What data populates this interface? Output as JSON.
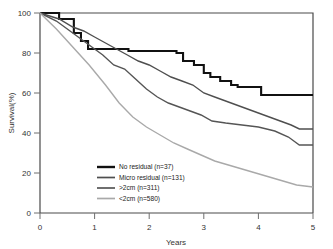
{
  "chart_data": {
    "type": "line",
    "title": "",
    "xlabel": "Years",
    "ylabel": "Survival(%)",
    "xlim": [
      0,
      5
    ],
    "ylim": [
      0,
      100
    ],
    "xticks": [
      "0",
      "1",
      "2",
      "3",
      "4",
      "5"
    ],
    "yticks": [
      "0",
      "20",
      "40",
      "60",
      "80",
      "100"
    ],
    "grid": false,
    "legend_position": "lower-left-inside",
    "series": [
      {
        "name": "No residual (n=37)",
        "color": "#111111",
        "width": 2.1,
        "final_value": 59,
        "x": [
          0,
          0.35,
          0.35,
          0.62,
          0.62,
          0.75,
          0.75,
          0.88,
          0.88,
          1.62,
          1.62,
          2.5,
          2.5,
          2.62,
          2.62,
          2.82,
          2.82,
          3.0,
          3.0,
          3.12,
          3.12,
          3.3,
          3.3,
          3.5,
          3.5,
          3.62,
          3.62,
          4.05,
          4.05,
          5.0
        ],
        "y": [
          100,
          100,
          97,
          97,
          90,
          90,
          86,
          86,
          82,
          82,
          81,
          81,
          80,
          80,
          76,
          76,
          74,
          74,
          70,
          70,
          68,
          68,
          66,
          66,
          64,
          64,
          63,
          63,
          59,
          59
        ]
      },
      {
        "name": "Micro residual (n=131)",
        "color": "#4f4f4f",
        "width": 1.4,
        "final_value": 42,
        "x": [
          0,
          0.35,
          0.6,
          0.8,
          1.0,
          1.2,
          1.4,
          1.6,
          1.8,
          2.0,
          2.2,
          2.4,
          2.6,
          2.8,
          3.0,
          3.2,
          3.4,
          3.6,
          3.8,
          4.0,
          4.2,
          4.4,
          4.6,
          4.75,
          5.0
        ],
        "y": [
          100,
          97,
          93,
          91,
          88,
          85,
          82,
          79,
          76,
          74,
          71,
          68,
          66,
          64,
          60,
          58,
          56,
          54,
          52,
          50,
          48,
          46,
          44,
          42,
          42
        ]
      },
      {
        "name": ">2cm (n=311)",
        "color": "#555555",
        "width": 1.4,
        "final_value": 34,
        "x": [
          0,
          0.3,
          0.55,
          0.75,
          0.95,
          1.15,
          1.35,
          1.55,
          1.75,
          1.95,
          2.15,
          2.35,
          2.55,
          2.75,
          2.95,
          3.15,
          3.4,
          3.7,
          4.0,
          4.3,
          4.55,
          4.75,
          5.0
        ],
        "y": [
          100,
          96,
          91,
          87,
          83,
          79,
          74,
          72,
          67,
          62,
          58,
          55,
          53,
          51,
          49,
          46,
          45,
          44,
          43,
          41,
          38,
          34,
          34
        ]
      },
      {
        "name": "<2cm (n=580)",
        "color": "#a9a9a9",
        "width": 1.4,
        "final_value": 13,
        "x": [
          0,
          0.3,
          0.6,
          0.9,
          1.2,
          1.45,
          1.7,
          1.95,
          2.2,
          2.45,
          2.7,
          2.95,
          3.2,
          3.45,
          3.7,
          3.95,
          4.2,
          4.45,
          4.7,
          5.0
        ],
        "y": [
          100,
          92,
          83,
          74,
          64,
          55,
          48,
          43,
          39,
          35,
          32,
          29,
          26,
          24,
          22,
          20,
          18,
          16,
          14,
          13
        ]
      }
    ]
  },
  "legend": {
    "items": [
      {
        "label": "No residual (n=37)"
      },
      {
        "label": "Micro residual (n=131)"
      },
      {
        "label": ">2cm (n=311)"
      },
      {
        "label": "<2cm (n=580)"
      }
    ]
  }
}
